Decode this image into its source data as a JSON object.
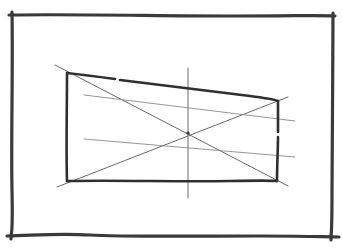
{
  "sketch": {
    "description": "Pencil sketch of a rectangle in perspective with diagonals, center line, and horizontal guide lines inside a hand-drawn frame",
    "colors": {
      "paper": "#ffffff",
      "heavy_stroke": "#2f2f2f",
      "light_stroke": "#8a8a8a"
    },
    "frame": {
      "top": [
        [
          10,
          15
        ],
        [
          335,
          16
        ]
      ],
      "left": [
        [
          12,
          13
        ],
        [
          11,
          238
        ]
      ],
      "right": [
        [
          333,
          14
        ],
        [
          331,
          238
        ]
      ],
      "bottom": [
        [
          8,
          236
        ],
        [
          338,
          237
        ]
      ]
    },
    "quad": {
      "top_left": [
        67,
        73
      ],
      "top_right": [
        278,
        101
      ],
      "bottom_right": [
        277,
        181
      ],
      "bottom_left": [
        67,
        181
      ]
    },
    "diagonals": [
      [
        [
          55,
          65
        ],
        [
          288,
          186
        ]
      ],
      [
        [
          57,
          187
        ],
        [
          288,
          97
        ]
      ]
    ],
    "center_point": [
      188,
      133
    ],
    "vertical_center_line": [
      [
        188,
        68
      ],
      [
        188,
        198
      ]
    ],
    "horizontal_guides": [
      [
        [
          84,
          95
        ],
        [
          295,
          121
        ]
      ],
      [
        [
          84,
          139
        ],
        [
          295,
          157
        ]
      ]
    ]
  }
}
